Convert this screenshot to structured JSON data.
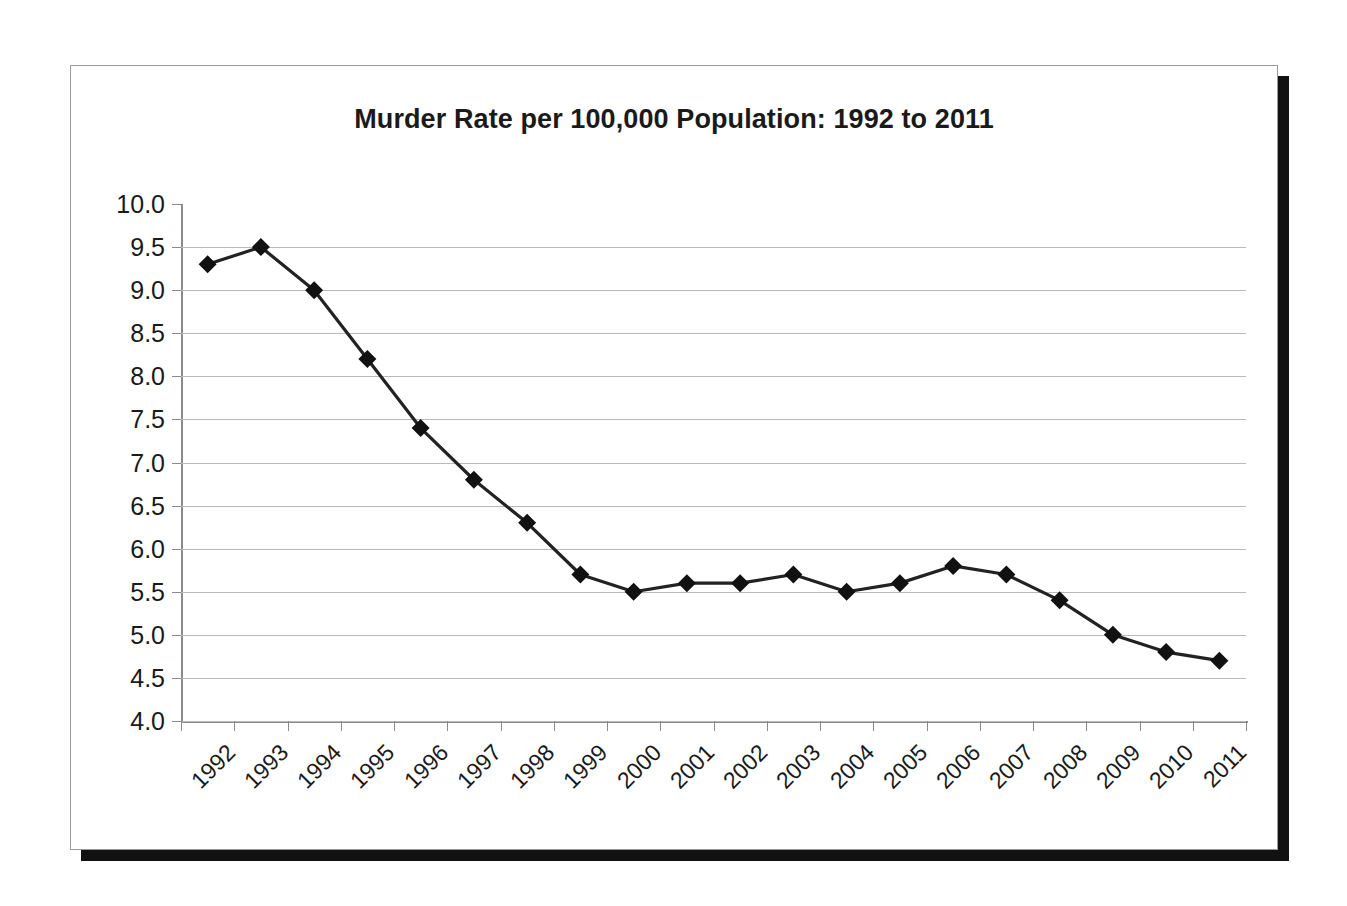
{
  "chart": {
    "title": "Murder Rate per 100,000 Population: 1992 to 2011"
  },
  "chart_data": {
    "type": "line",
    "title": "Murder Rate per 100,000 Population: 1992 to 2011",
    "xlabel": "",
    "ylabel": "",
    "categories": [
      "1992",
      "1993",
      "1994",
      "1995",
      "1996",
      "1997",
      "1998",
      "1999",
      "2000",
      "2001",
      "2002",
      "2003",
      "2004",
      "2005",
      "2006",
      "2007",
      "2008",
      "2009",
      "2010",
      "2011"
    ],
    "values": [
      9.3,
      9.5,
      9.0,
      8.2,
      7.4,
      6.8,
      6.3,
      5.7,
      5.5,
      5.6,
      5.6,
      5.7,
      5.5,
      5.6,
      5.8,
      5.7,
      5.4,
      5.0,
      4.8,
      4.7
    ],
    "series": [
      {
        "name": "Murder rate per 100,000",
        "values": [
          9.3,
          9.5,
          9.0,
          8.2,
          7.4,
          6.8,
          6.3,
          5.7,
          5.5,
          5.6,
          5.6,
          5.7,
          5.5,
          5.6,
          5.8,
          5.7,
          5.4,
          5.0,
          4.8,
          4.7
        ]
      }
    ],
    "ylim": [
      4.0,
      10.0
    ],
    "ytick_step": 0.5,
    "ytick_labels": [
      "10.0",
      "9.5",
      "9.0",
      "8.5",
      "8.0",
      "7.5",
      "7.0",
      "6.5",
      "6.0",
      "5.5",
      "5.0",
      "4.5",
      "4.0"
    ],
    "ytick_values": [
      10.0,
      9.5,
      9.0,
      8.5,
      8.0,
      7.5,
      7.0,
      6.5,
      6.0,
      5.5,
      5.0,
      4.5,
      4.0
    ],
    "grid": true,
    "grid_axis": "y",
    "legend": false,
    "legend_position": "none",
    "marker": "diamond",
    "marker_color": "#111111",
    "line_color": "#222222",
    "gridline_color": "#b9b9b9",
    "axis_color": "#8a8a8a",
    "plot_background": "#ffffff",
    "xtick_label_rotation": -45
  }
}
